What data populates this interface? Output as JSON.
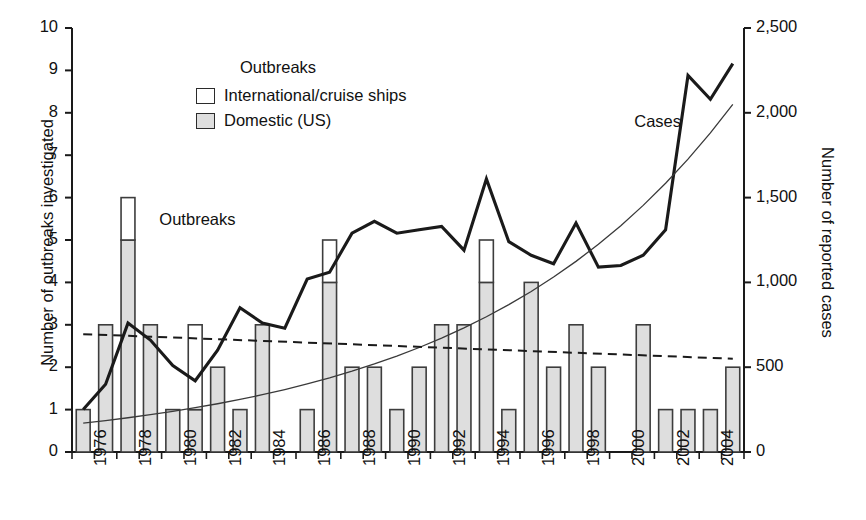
{
  "chart_data": {
    "type": "bar",
    "title": "",
    "xlabel": "",
    "ylabel": "Number of outbreaks investigated",
    "ylabel_right": "Number of reported cases",
    "ylim": [
      0,
      10
    ],
    "ylim_right": [
      0,
      2500
    ],
    "yticks": [
      "0",
      "1",
      "2",
      "3",
      "4",
      "5",
      "6",
      "7",
      "8",
      "9",
      "10"
    ],
    "yticks_right": [
      "0",
      "500",
      "1,000",
      "1,500",
      "2,000",
      "2,500"
    ],
    "grid": false,
    "legend_position": "upper-center",
    "x": [
      1976,
      1977,
      1978,
      1979,
      1980,
      1981,
      1982,
      1983,
      1984,
      1985,
      1986,
      1987,
      1988,
      1989,
      1990,
      1991,
      1992,
      1993,
      1994,
      1995,
      1996,
      1997,
      1998,
      1999,
      2000,
      2001,
      2002,
      2003,
      2004,
      2005
    ],
    "xtick_labels": [
      "1976",
      "1978",
      "1980",
      "1982",
      "1984",
      "1986",
      "1988",
      "1990",
      "1992",
      "1994",
      "1996",
      "1998",
      "2000",
      "2002",
      "2004"
    ],
    "xtick_years": [
      1976,
      1978,
      1980,
      1982,
      1984,
      1986,
      1988,
      1990,
      1992,
      1994,
      1996,
      1998,
      2000,
      2002,
      2004
    ],
    "categories": [
      "1976",
      "1977",
      "1978",
      "1979",
      "1980",
      "1981",
      "1982",
      "1983",
      "1984",
      "1985",
      "1986",
      "1987",
      "1988",
      "1989",
      "1990",
      "1991",
      "1992",
      "1993",
      "1994",
      "1995",
      "1996",
      "1997",
      "1998",
      "1999",
      "2000",
      "2001",
      "2002",
      "2003",
      "2004",
      "2005"
    ],
    "series": [
      {
        "name": "Domestic (US)",
        "key": "domestic",
        "color": "#dedede",
        "values": [
          1,
          3,
          5,
          3,
          1,
          1,
          2,
          1,
          3,
          0,
          1,
          4,
          2,
          2,
          1,
          2,
          3,
          3,
          4,
          1,
          4,
          2,
          3,
          2,
          0,
          3,
          1,
          1,
          1,
          2
        ]
      },
      {
        "name": "International/cruise ships",
        "key": "international",
        "color": "#ffffff",
        "values": [
          0,
          0,
          1,
          0,
          0,
          2,
          0,
          0,
          0,
          0,
          0,
          1,
          0,
          0,
          0,
          0,
          0,
          0,
          1,
          0,
          0,
          0,
          0,
          0,
          0,
          0,
          0,
          0,
          0,
          0
        ]
      },
      {
        "name": "Cases",
        "key": "cases",
        "type": "line",
        "axis": "right",
        "color": "#1a1a1a",
        "values": [
          250,
          400,
          760,
          660,
          510,
          420,
          600,
          850,
          760,
          730,
          1020,
          1060,
          1290,
          1360,
          1290,
          1310,
          1330,
          1190,
          1610,
          1240,
          1160,
          1110,
          1350,
          1090,
          1100,
          1160,
          1310,
          2220,
          2080,
          2290
        ]
      },
      {
        "name": "Cases trend",
        "key": "cases_trend",
        "type": "trendline",
        "axis": "right",
        "style": "solid-thin",
        "color": "#3a3a3a",
        "endpoints": [
          170,
          2050
        ]
      },
      {
        "name": "Outbreaks trend",
        "key": "outbreaks_trend",
        "type": "trendline",
        "axis": "left",
        "style": "dashed",
        "color": "#1a1a1a",
        "endpoints": [
          2.78,
          2.2
        ]
      }
    ],
    "annotations": [
      {
        "text": "Outbreaks",
        "x": 1979.4,
        "y": 5.45,
        "name": "outbreaks-line-annotation"
      },
      {
        "text": "Cases",
        "x": 2000.6,
        "y": 7.75,
        "name": "cases-line-annotation"
      }
    ]
  },
  "legend": {
    "title": "Outbreaks",
    "items": [
      {
        "label": "International/cruise ships",
        "swatch": "white"
      },
      {
        "label": "Domestic (US)",
        "swatch": "gray"
      }
    ]
  },
  "axes": {
    "left_title": "Number of outbreaks investigated",
    "right_title": "Number of reported cases"
  },
  "colors": {
    "domestic_fill": "#dedede",
    "international_fill": "#ffffff",
    "bar_stroke": "#3d3d3d",
    "cases_line": "#1a1a1a",
    "trend_line": "#3a3a3a",
    "axis": "#1a1a1a",
    "background": "#ffffff"
  }
}
